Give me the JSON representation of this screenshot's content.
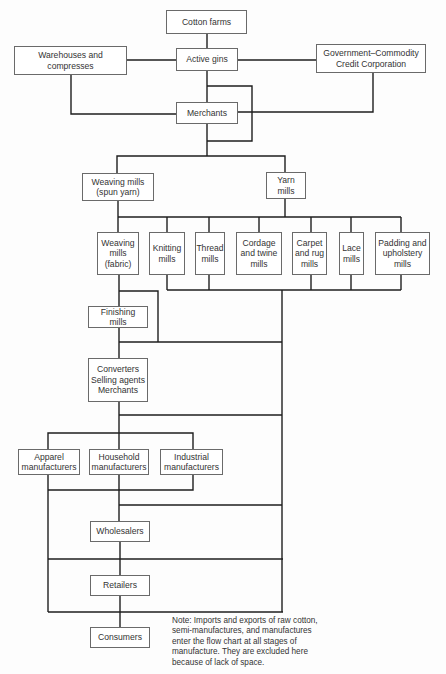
{
  "diagram": {
    "type": "flowchart",
    "title": "",
    "nodes": {
      "cotton_farms": "Cotton farms",
      "active_gins": "Active gins",
      "warehouses": "Warehouses and\ncompresses",
      "government": "Government–Commodity\nCredit Corporation",
      "merchants": "Merchants",
      "weaving_spun": "Weaving mills\n(spun yarn)",
      "yarn_mills": "Yarn\nmills",
      "weaving_fabric": "Weaving\nmills\n(fabric)",
      "knitting": "Knitting\nmills",
      "thread": "Thread\nmills",
      "cordage": "Cordage\nand twine\nmills",
      "carpet": "Carpet\nand rug\nmills",
      "lace": "Lace\nmills",
      "padding": "Padding and\nupholstery\nmills",
      "finishing": "Finishing\nmills",
      "converters": "Converters\nSelling agents\nMerchants",
      "apparel": "Apparel\nmanufacturers",
      "household": "Household\nmanufacturers",
      "industrial": "Industrial\nmanufacturers",
      "wholesalers": "Wholesalers",
      "retailers": "Retailers",
      "consumers": "Consumers"
    },
    "edges": [
      [
        "Cotton farms",
        "Active gins"
      ],
      [
        "Active gins",
        "Warehouses and compresses"
      ],
      [
        "Active gins",
        "Government–Commodity Credit Corporation"
      ],
      [
        "Active gins",
        "Merchants"
      ],
      [
        "Warehouses and compresses",
        "Merchants"
      ],
      [
        "Government–Commodity Credit Corporation",
        "Merchants"
      ],
      [
        "Merchants",
        "Weaving mills (spun yarn)"
      ],
      [
        "Merchants",
        "Yarn mills"
      ],
      [
        "Weaving mills (spun yarn)",
        "Weaving mills (fabric)"
      ],
      [
        "Yarn mills",
        "Knitting mills"
      ],
      [
        "Yarn mills",
        "Thread mills"
      ],
      [
        "Yarn mills",
        "Cordage and twine mills"
      ],
      [
        "Yarn mills",
        "Carpet and rug mills"
      ],
      [
        "Yarn mills",
        "Lace mills"
      ],
      [
        "Yarn mills",
        "Padding and upholstery mills"
      ],
      [
        "Weaving mills (fabric)",
        "Finishing mills"
      ],
      [
        "Finishing mills",
        "Converters / Selling agents / Merchants"
      ],
      [
        "Converters / Selling agents / Merchants",
        "Apparel manufacturers"
      ],
      [
        "Converters / Selling agents / Merchants",
        "Household manufacturers"
      ],
      [
        "Converters / Selling agents / Merchants",
        "Industrial manufacturers"
      ],
      [
        "Manufacturers",
        "Wholesalers"
      ],
      [
        "Wholesalers",
        "Retailers"
      ],
      [
        "Retailers",
        "Consumers"
      ]
    ],
    "note": "Note:  Imports and exports of raw cotton,\nsemi-manufactures, and manufactures\nenter the flow chart at all stages of\nmanufacture.  They are excluded here\nbecause of lack of space."
  }
}
